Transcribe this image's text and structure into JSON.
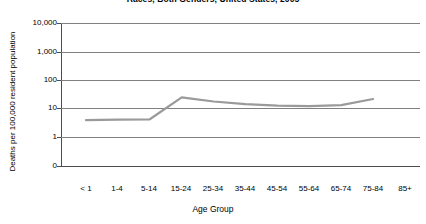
{
  "chart_data": {
    "type": "line",
    "title": "Races, Both Genders, United States, 2005",
    "xlabel": "Age Group",
    "ylabel": "Deaths per 100,000 resident population",
    "categories": [
      "< 1",
      "1-4",
      "5-14",
      "15-24",
      "25-34",
      "35-44",
      "45-54",
      "55-64",
      "65-74",
      "75-84",
      "85+"
    ],
    "series": [
      {
        "name": "Death rate",
        "values": [
          4.0,
          4.2,
          4.3,
          25.0,
          18.0,
          14.5,
          13.0,
          12.5,
          13.5,
          22.0,
          null
        ]
      }
    ],
    "y_ticks": [
      "10,000",
      "1,000",
      "100",
      "10",
      "1",
      "0"
    ],
    "y_tick_values": [
      10000,
      1000,
      100,
      10,
      1,
      0
    ],
    "yscale": "log",
    "grid": true,
    "legend": "none",
    "line_color": "#9a9a9a",
    "axis_color": "#4d4d4d",
    "grid_color": "#808080"
  }
}
